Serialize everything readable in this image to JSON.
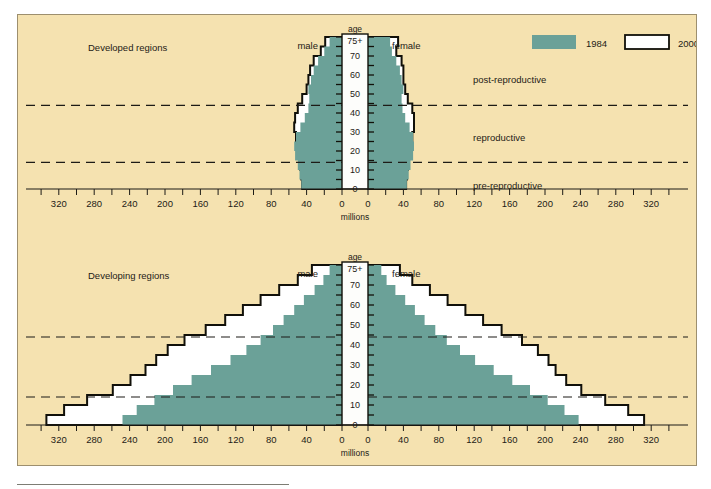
{
  "figure": {
    "background_color": "#f5e2b0",
    "teal_color": "#6ba198",
    "outline_color": "#111009"
  },
  "legend": {
    "items": [
      {
        "label": "1984",
        "swatch": "filled-teal"
      },
      {
        "label": "2000",
        "swatch": "outlined-white"
      }
    ]
  },
  "annotations": {
    "post_reproductive": "post-reproductive",
    "reproductive": "reproductive",
    "pre_reproductive": "pre-reproductive"
  },
  "axis_common": {
    "age_title": "age",
    "x_title": "millions",
    "male_label": "male",
    "female_label": "female",
    "x_ticks_left": [
      "320",
      "280",
      "240",
      "200",
      "160",
      "120",
      "80",
      "40",
      "0"
    ],
    "x_ticks_right": [
      "0",
      "40",
      "80",
      "120",
      "160",
      "200",
      "240",
      "280",
      "320"
    ],
    "age_ticks": [
      "0",
      "10",
      "20",
      "30",
      "40",
      "50",
      "60",
      "70",
      "75+"
    ],
    "age_bands": [
      "0-4",
      "5-9",
      "10-14",
      "15-19",
      "20-24",
      "25-29",
      "30-34",
      "35-39",
      "40-44",
      "45-49",
      "50-54",
      "55-59",
      "60-64",
      "65-69",
      "70-74",
      "75+"
    ]
  },
  "chart_data": [
    {
      "type": "bar",
      "orientation": "population-pyramid",
      "title": "Developed regions",
      "xlabel": "millions",
      "ylabel": "age",
      "xlim": [
        -340,
        340
      ],
      "grid": false,
      "legend": [
        "1984",
        "2000"
      ],
      "legend_position": "top-right",
      "categories": [
        "0-4",
        "5-9",
        "10-14",
        "15-19",
        "20-24",
        "25-29",
        "30-34",
        "35-39",
        "40-44",
        "45-49",
        "50-54",
        "55-59",
        "60-64",
        "65-69",
        "70-74",
        "75+"
      ],
      "series": [
        {
          "name": "male 1984",
          "values": [
            46,
            48,
            50,
            53,
            54,
            52,
            47,
            42,
            38,
            37,
            38,
            35,
            32,
            27,
            20,
            14
          ]
        },
        {
          "name": "female 1984",
          "values": [
            44,
            46,
            48,
            51,
            52,
            51,
            47,
            42,
            39,
            38,
            40,
            38,
            36,
            32,
            27,
            25
          ]
        },
        {
          "name": "male 2000",
          "values": [
            45,
            46,
            47,
            48,
            50,
            52,
            54,
            53,
            50,
            45,
            40,
            38,
            36,
            32,
            24,
            19
          ]
        },
        {
          "name": "female 2000",
          "values": [
            43,
            44,
            45,
            46,
            48,
            50,
            52,
            52,
            50,
            45,
            42,
            40,
            40,
            38,
            32,
            34
          ]
        }
      ],
      "annotations": [
        {
          "text": "post-reproductive",
          "at_age": 50
        },
        {
          "text": "reproductive",
          "at_age": 25
        },
        {
          "text": "pre-reproductive",
          "at_age": 7
        }
      ],
      "divider_ages": [
        44,
        14
      ]
    },
    {
      "type": "bar",
      "orientation": "population-pyramid",
      "title": "Developing regions",
      "xlabel": "millions",
      "ylabel": "age",
      "xlim": [
        -340,
        340
      ],
      "grid": false,
      "legend": [
        "1984",
        "2000"
      ],
      "categories": [
        "0-4",
        "5-9",
        "10-14",
        "15-19",
        "20-24",
        "25-29",
        "30-34",
        "35-39",
        "40-44",
        "45-49",
        "50-54",
        "55-59",
        "60-64",
        "65-69",
        "70-74",
        "75+"
      ],
      "series": [
        {
          "name": "male 1984",
          "values": [
            248,
            232,
            212,
            191,
            170,
            148,
            126,
            108,
            92,
            78,
            66,
            54,
            43,
            31,
            21,
            14
          ]
        },
        {
          "name": "female 1984",
          "values": [
            238,
            222,
            203,
            183,
            163,
            142,
            121,
            104,
            89,
            76,
            64,
            53,
            42,
            31,
            21,
            15
          ]
        },
        {
          "name": "male 2000",
          "values": [
            334,
            314,
            288,
            259,
            239,
            222,
            210,
            197,
            178,
            154,
            132,
            112,
            92,
            71,
            50,
            34
          ]
        },
        {
          "name": "female 2000",
          "values": [
            312,
            294,
            268,
            241,
            224,
            212,
            204,
            192,
            174,
            151,
            130,
            110,
            90,
            70,
            50,
            36
          ]
        }
      ],
      "divider_ages": [
        44,
        14
      ]
    }
  ]
}
